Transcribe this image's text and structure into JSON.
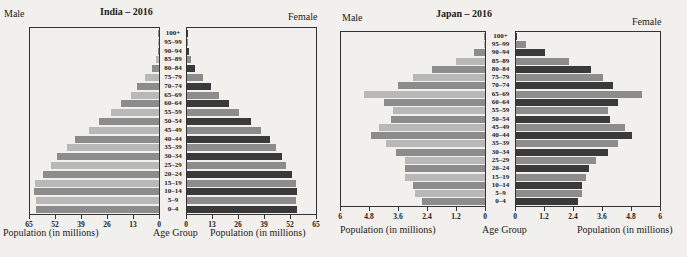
{
  "chart_data": [
    {
      "type": "bar",
      "subtype": "population-pyramid",
      "title": "India – 2016",
      "left_label": "Male",
      "right_label": "Female",
      "xlabel_left": "Population (in millions)",
      "xlabel_center": "Age Group",
      "xlabel_right": "Population (in millions)",
      "xlim": [
        0,
        65
      ],
      "ticks": [
        0,
        13,
        26,
        39,
        52,
        65
      ],
      "tick_labels_left": [
        "65",
        "52",
        "39",
        "26",
        "13",
        "0"
      ],
      "tick_labels_right": [
        "0",
        "13",
        "26",
        "39",
        "52",
        "65"
      ],
      "categories": [
        "100+",
        "95–99",
        "90–94",
        "85–89",
        "80–84",
        "75–79",
        "70–74",
        "65–69",
        "60–64",
        "55–59",
        "50–54",
        "45–49",
        "40–44",
        "35–39",
        "30–34",
        "25–29",
        "20–24",
        "15–19",
        "10–14",
        "5–9",
        "0–4"
      ],
      "series": [
        {
          "name": "Male",
          "values": [
            0.05,
            0.3,
            0.6,
            1.5,
            3.5,
            7,
            11,
            14,
            19,
            24,
            30,
            35,
            42,
            46,
            51,
            54,
            58,
            62,
            62.5,
            61.5,
            61.5
          ]
        },
        {
          "name": "Female",
          "values": [
            0.05,
            0.3,
            0.8,
            2,
            4,
            8,
            12,
            16,
            21,
            26,
            32,
            37,
            41.5,
            44.5,
            47.5,
            49.5,
            52.5,
            54.5,
            55,
            54.5,
            55
          ]
        }
      ]
    },
    {
      "type": "bar",
      "subtype": "population-pyramid",
      "title": "Japan – 2016",
      "left_label": "Male",
      "right_label": "Female",
      "xlabel_left": "Population (in millions)",
      "xlabel_center": "Age Group",
      "xlabel_right": "Population (in millions)",
      "xlim": [
        0,
        6
      ],
      "ticks": [
        0,
        1.2,
        2.4,
        3.6,
        4.8,
        6
      ],
      "tick_labels_left": [
        "6",
        "4.8",
        "3.6",
        "2.4",
        "1.2",
        "0"
      ],
      "tick_labels_right": [
        "0",
        "1.2",
        "2.4",
        "3.6",
        "4.8",
        "6"
      ],
      "categories": [
        "100+",
        "95–99",
        "90–94",
        "85–89",
        "80–84",
        "75–79",
        "70–74",
        "65–69",
        "60–64",
        "55–59",
        "50–54",
        "45–49",
        "40–44",
        "35–39",
        "30–34",
        "25–29",
        "20–24",
        "15–19",
        "10–14",
        "5–9",
        "0–4"
      ],
      "series": [
        {
          "name": "Male",
          "values": [
            0.01,
            0.05,
            0.45,
            1.2,
            2.2,
            3.0,
            3.6,
            5.0,
            4.2,
            3.8,
            3.9,
            4.4,
            4.7,
            4.1,
            3.7,
            3.3,
            3.3,
            3.3,
            3.0,
            2.9,
            2.6
          ]
        },
        {
          "name": "Female",
          "values": [
            0.06,
            0.4,
            1.2,
            2.2,
            3.1,
            3.6,
            4.0,
            5.2,
            4.2,
            3.8,
            3.9,
            4.5,
            4.8,
            4.2,
            3.8,
            3.3,
            3.0,
            2.9,
            2.75,
            2.75,
            2.55
          ]
        }
      ]
    }
  ],
  "colors": {
    "background": "#f2f0ec",
    "male_a": "#8c8c8c",
    "male_b": "#b8b8b8",
    "female_a": "#3a3a3a",
    "female_b": "#8c8c8c"
  }
}
